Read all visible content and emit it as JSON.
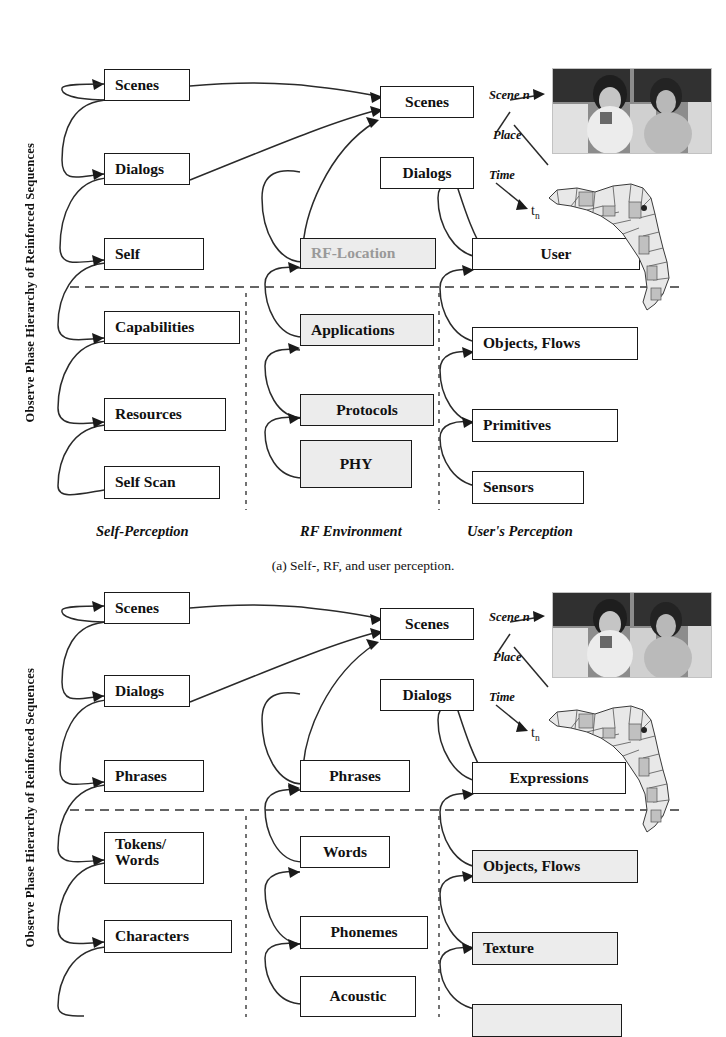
{
  "figure": {
    "vertical_axis_label": "Observe Phase Hierarchy of Reinforced Sequences",
    "panels": [
      {
        "id": "a",
        "caption": "(a)  Self-, RF, and user perception.",
        "column_captions": [
          "Self-Perception",
          "RF Environment",
          "User's Perception"
        ],
        "annotations": {
          "scene": "Scene n",
          "place": "Place",
          "time": "Time",
          "tn": "t",
          "tn_sub": "n"
        },
        "columns": [
          {
            "name": "self-perception",
            "nodes": [
              {
                "label": "Scenes",
                "style": "white"
              },
              {
                "label": "Dialogs",
                "style": "white"
              },
              {
                "label": "Self",
                "style": "white"
              },
              {
                "label": "Capabilities",
                "style": "white"
              },
              {
                "label": "Resources",
                "style": "white"
              },
              {
                "label": "Self Scan",
                "style": "white"
              }
            ]
          },
          {
            "name": "rf-environment",
            "nodes": [
              {
                "label": "RF-Location",
                "style": "gray-text"
              },
              {
                "label": "Applications",
                "style": "gray"
              },
              {
                "label": "Protocols",
                "style": "gray"
              },
              {
                "label": "PHY",
                "style": "gray"
              }
            ]
          },
          {
            "name": "users-perception",
            "nodes": [
              {
                "label": "Scenes",
                "style": "white"
              },
              {
                "label": "Dialogs",
                "style": "white"
              },
              {
                "label": "User",
                "style": "white"
              },
              {
                "label": "Objects, Flows",
                "style": "white"
              },
              {
                "label": "Primitives",
                "style": "white"
              },
              {
                "label": "Sensors",
                "style": "white"
              }
            ]
          }
        ]
      },
      {
        "id": "b",
        "caption": "",
        "column_captions": [
          "",
          "",
          ""
        ],
        "annotations": {
          "scene": "Scene n",
          "place": "Place",
          "time": "Time",
          "tn": "t",
          "tn_sub": "n"
        },
        "columns": [
          {
            "name": "language-hierarchy",
            "nodes": [
              {
                "label": "Scenes",
                "style": "white"
              },
              {
                "label": "Dialogs",
                "style": "white"
              },
              {
                "label": "Phrases",
                "style": "white"
              },
              {
                "label": "Tokens/",
                "label2": "Words",
                "style": "white"
              },
              {
                "label": "Characters",
                "style": "white"
              }
            ]
          },
          {
            "name": "speech-hierarchy",
            "nodes": [
              {
                "label": "Phrases",
                "style": "white"
              },
              {
                "label": "Words",
                "style": "white"
              },
              {
                "label": "Phonemes",
                "style": "white"
              },
              {
                "label": "Acoustic",
                "style": "white"
              }
            ]
          },
          {
            "name": "scene-hierarchy",
            "nodes": [
              {
                "label": "Scenes",
                "style": "white"
              },
              {
                "label": "Dialogs",
                "style": "white"
              },
              {
                "label": "Expressions",
                "style": "white"
              },
              {
                "label": "Objects, Flows",
                "style": "gray"
              },
              {
                "label": "Texture",
                "style": "gray"
              }
            ]
          }
        ]
      }
    ],
    "images": [
      {
        "name": "people-photo",
        "description": "grayscale photograph of two people"
      },
      {
        "name": "florida-county-map",
        "description": "grayscale county map of Florida"
      }
    ],
    "colors": {
      "line": "#2a2a2a",
      "box_fill_gray": "#ececec",
      "text": "#111111",
      "muted_text": "#999999"
    }
  }
}
